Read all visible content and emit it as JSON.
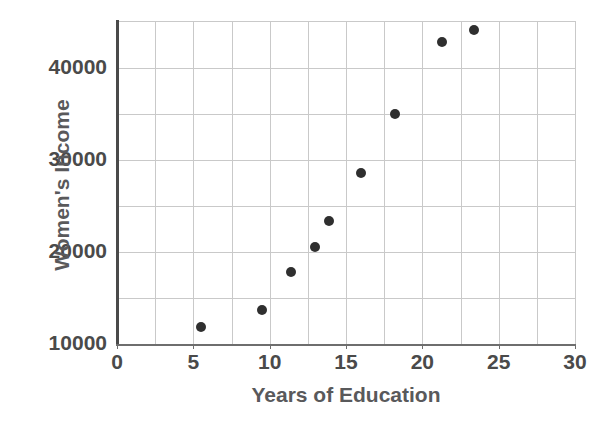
{
  "chart_data": {
    "type": "scatter",
    "title": "",
    "xlabel": "Years of Education",
    "ylabel": "Women's Income",
    "xlim": [
      0,
      30
    ],
    "ylim": [
      10000,
      45000
    ],
    "xticks": [
      0,
      5,
      10,
      15,
      20,
      25,
      30
    ],
    "xtick_labels": [
      "0",
      "5",
      "10",
      "15",
      "20",
      "25",
      "30"
    ],
    "yticks": [
      10000,
      20000,
      30000,
      40000
    ],
    "ytick_labels": [
      "10000",
      "20000",
      "30000",
      "40000"
    ],
    "x_gridlines": [
      2.5,
      5,
      7.5,
      10,
      12.5,
      15,
      17.5,
      20,
      22.5,
      25,
      27.5
    ],
    "y_gridlines": [
      15000,
      20000,
      25000,
      30000,
      35000,
      40000
    ],
    "grid": true,
    "legend": "none",
    "marker_color": "#2f2f2f",
    "marker_size": 10,
    "axis_color": "#4a4a4a",
    "grid_color": "#c9c9c9",
    "label_color": "#59595b",
    "x": [
      5.5,
      9.5,
      11.4,
      13.0,
      13.9,
      16.0,
      18.2,
      21.3,
      23.4
    ],
    "y": [
      11900,
      13700,
      17800,
      20500,
      23400,
      28600,
      35000,
      42800,
      44100
    ],
    "points": [
      {
        "x": 5.5,
        "y": 11900
      },
      {
        "x": 9.5,
        "y": 13700
      },
      {
        "x": 11.4,
        "y": 17800
      },
      {
        "x": 13.0,
        "y": 20500
      },
      {
        "x": 13.9,
        "y": 23400
      },
      {
        "x": 16.0,
        "y": 28600
      },
      {
        "x": 18.2,
        "y": 35000
      },
      {
        "x": 21.3,
        "y": 42800
      },
      {
        "x": 23.4,
        "y": 44100
      }
    ]
  }
}
